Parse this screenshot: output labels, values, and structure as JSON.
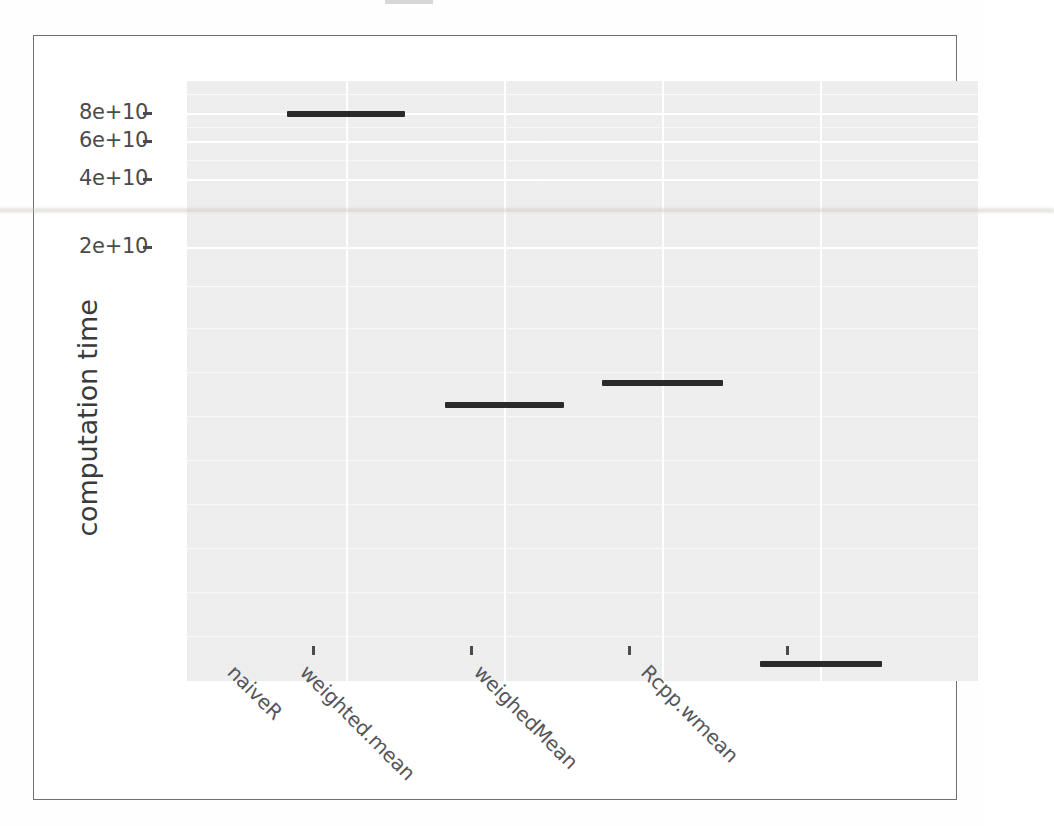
{
  "figure": {
    "y_axis_title": "computation time",
    "title_cutoff": true,
    "background": "#ffffff",
    "panel_background": "#ebebeb",
    "gridline_color": "#ffffff",
    "mark_color": "#2a2a2a",
    "axis_text_color": "#4b4b4d"
  },
  "chart_data": {
    "type": "bar",
    "title": "",
    "subtitle": "",
    "xlabel": "",
    "ylabel": "computation time",
    "categories": [
      "naiveR",
      "weighted.mean",
      "weighedMean",
      "Rcpp.wmean"
    ],
    "values": [
      81000000000,
      12800000000,
      14600000000,
      1500000000
    ],
    "value_labels": [
      "8.1e+10",
      "1.28e+10",
      "1.46e+10",
      "1.5e+09"
    ],
    "ytick_labels": [
      "8e+10",
      "6e+10",
      "4e+10",
      "2e+10"
    ],
    "ytick_values": [
      80000000000,
      60000000000,
      40000000000,
      20000000000
    ],
    "ylim": [
      0,
      90000000000
    ],
    "grid": true,
    "legend": "none",
    "mark_style": "horizontal-crossbar"
  },
  "axis": {
    "y_ticks": [
      {
        "label": "8e+10",
        "y": 77
      },
      {
        "label": "6e+10",
        "y": 105
      },
      {
        "label": "4e+10",
        "y": 143
      },
      {
        "label": "2e+10",
        "y": 211
      }
    ],
    "x_ticks": [
      {
        "label": "naiveR",
        "x": 312
      },
      {
        "label": "weighted.mean",
        "x": 470
      },
      {
        "label": "weighedMean",
        "x": 628
      },
      {
        "label": "Rcpp.wmean",
        "x": 786
      }
    ]
  },
  "marks": [
    {
      "name": "naiveR",
      "x": 253,
      "y": 75,
      "width": 118
    },
    {
      "name": "weighted.mean",
      "x": 411,
      "y": 366,
      "width": 119
    },
    {
      "name": "weighedMean",
      "x": 568,
      "y": 344,
      "width": 121
    },
    {
      "name": "Rcpp.wmean",
      "x": 726,
      "y": 625,
      "width": 122
    }
  ],
  "gridlines": {
    "horizontal_major_y": [
      77,
      105,
      143,
      211
    ],
    "horizontal_minor_y": [
      58,
      91,
      124,
      176,
      250,
      292,
      336,
      380,
      424,
      468,
      512,
      556,
      600
    ],
    "vertical_major_x": [
      312,
      470,
      628,
      786
    ]
  }
}
